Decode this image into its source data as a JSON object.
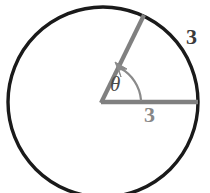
{
  "figure": {
    "kind": "circle-with-central-angle",
    "labels": {
      "angle_symbol": "θ",
      "radius_slanted_length": "3",
      "radius_horizontal_length": "3"
    },
    "colors": {
      "circle_stroke": "#1a1a1a",
      "radius_stroke": "#808080",
      "arc_stroke": "#8a8a8a",
      "angle_label_color": "#4a4a4a",
      "outer_label_color": "#3a3a3a",
      "inner_label_color": "#878787",
      "background": "#ffffff"
    },
    "geometry": {
      "center_x": 103,
      "center_y": 102,
      "radius": 95,
      "circle_stroke_width": 3.4,
      "radius_stroke_width": 4.2,
      "horizontal_radius_endpoint_x": 198,
      "horizontal_radius_endpoint_y": 102,
      "slanted_radius_endpoint_x": 144,
      "slanted_radius_endpoint_y": 15,
      "slanted_radius_angle_degrees": 66,
      "angle_arc_radius": 38,
      "arrow_head_size": 9
    }
  }
}
